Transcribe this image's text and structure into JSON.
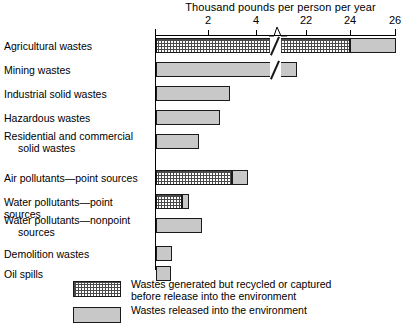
{
  "chart": {
    "type": "bar-horizontal-stacked",
    "axis_title": "Thousand pounds per person per year",
    "tick_labels": [
      "2",
      "4",
      "22",
      "24",
      "26"
    ],
    "legend": [
      {
        "swatch": "recycled",
        "label": "Wastes generated but recycled or captured\nbefore release into the environment"
      },
      {
        "swatch": "released",
        "label": "Wastes released into the environment"
      }
    ],
    "rows": [
      {
        "label": "Agricultural wastes",
        "indent": ""
      },
      {
        "label": "Mining wastes",
        "indent": ""
      },
      {
        "label": "Industrial solid wastes",
        "indent": ""
      },
      {
        "label": "Hazardous wastes",
        "indent": ""
      },
      {
        "label": "Residential and commercial",
        "indent": "solid wastes"
      },
      {
        "label": "Air pollutants—point sources",
        "indent": ""
      },
      {
        "label": "Water pollutants—point sources",
        "indent": ""
      },
      {
        "label": "Water pollutants—nonpoint",
        "indent": "sources"
      },
      {
        "label": "Demolition wastes",
        "indent": ""
      },
      {
        "label": "Oil spills",
        "indent": ""
      }
    ]
  },
  "chart_data": {
    "type": "bar",
    "title": "",
    "xlabel": "Thousand pounds per person per year",
    "ylabel": "",
    "orientation": "horizontal",
    "stacked": true,
    "axis_break": {
      "between": [
        4.6,
        21.4
      ],
      "marker": "zig-zag"
    },
    "xticks": [
      2,
      4,
      22,
      24,
      26
    ],
    "xlim": [
      0,
      26
    ],
    "grid": false,
    "legend_position": "bottom-left",
    "categories": [
      "Agricultural wastes",
      "Mining wastes",
      "Industrial solid wastes",
      "Hazardous wastes",
      "Residential and commercial solid wastes",
      "Air pollutants—point sources",
      "Water pollutants—point sources",
      "Water pollutants—nonpoint sources",
      "Demolition wastes",
      "Oil spills"
    ],
    "series": [
      {
        "name": "Wastes generated but recycled or captured before release into the environment",
        "color": "#ffffff",
        "pattern": "dotted-grid",
        "values": [
          24.0,
          0.0,
          0.0,
          0.0,
          0.0,
          3.2,
          1.1,
          0.0,
          0.0,
          0.0
        ]
      },
      {
        "name": "Wastes released into the environment",
        "color": "#c8c8c8",
        "pattern": "solid-gray",
        "values": [
          2.0,
          5.9,
          3.1,
          2.7,
          1.8,
          0.7,
          0.3,
          1.9,
          0.7,
          0.6
        ]
      }
    ],
    "totals": [
      26.0,
      5.9,
      3.1,
      2.7,
      1.8,
      3.9,
      1.4,
      1.9,
      0.7,
      0.6
    ]
  },
  "geometry": {
    "rows": [
      {
        "top": 38,
        "segments": [
          {
            "cls": "recycled",
            "left": 0,
            "width": 194
          },
          {
            "cls": "released",
            "left": 194,
            "width": 46
          }
        ],
        "break_left": 114
      },
      {
        "top": 62,
        "segments": [
          {
            "cls": "released",
            "left": 0,
            "width": 141
          }
        ],
        "break_left": 114
      },
      {
        "top": 86,
        "segments": [
          {
            "cls": "released",
            "left": 0,
            "width": 74
          }
        ],
        "break_left": null
      },
      {
        "top": 110,
        "segments": [
          {
            "cls": "released",
            "left": 0,
            "width": 64
          }
        ],
        "break_left": null
      },
      {
        "top": 134,
        "segments": [
          {
            "cls": "released",
            "left": 0,
            "width": 43
          }
        ],
        "break_left": null
      },
      {
        "top": 170,
        "segments": [
          {
            "cls": "recycled",
            "left": 0,
            "width": 76
          },
          {
            "cls": "released",
            "left": 76,
            "width": 16
          }
        ],
        "break_left": null
      },
      {
        "top": 194,
        "segments": [
          {
            "cls": "recycled",
            "left": 0,
            "width": 26
          },
          {
            "cls": "released",
            "left": 26,
            "width": 7
          }
        ],
        "break_left": null
      },
      {
        "top": 218,
        "segments": [
          {
            "cls": "released",
            "left": 0,
            "width": 46
          }
        ],
        "break_left": null
      },
      {
        "top": 246,
        "segments": [
          {
            "cls": "released",
            "left": 0,
            "width": 16
          }
        ],
        "break_left": null
      },
      {
        "top": 266,
        "segments": [
          {
            "cls": "released",
            "left": 0,
            "width": 15
          }
        ],
        "break_left": null
      }
    ],
    "row_labels": [
      {
        "top": 40
      },
      {
        "top": 64
      },
      {
        "top": 88
      },
      {
        "top": 112
      },
      {
        "top": 130
      },
      {
        "top": 172
      },
      {
        "top": 196
      },
      {
        "top": 214
      },
      {
        "top": 248
      },
      {
        "top": 268
      }
    ],
    "ticks": [
      208,
      256,
      306,
      350,
      395
    ]
  }
}
